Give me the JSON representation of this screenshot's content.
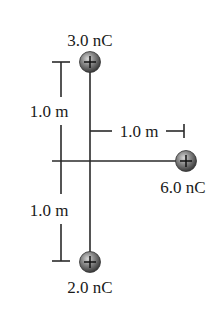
{
  "diagram": {
    "charges": [
      {
        "id": "top",
        "label": "3.0 nC",
        "sign": "+"
      },
      {
        "id": "right",
        "label": "6.0 nC",
        "sign": "+"
      },
      {
        "id": "bottom",
        "label": "2.0 nC",
        "sign": "+"
      }
    ],
    "dimensions": {
      "upper_vertical": "1.0 m",
      "lower_vertical": "1.0 m",
      "horizontal": "1.0 m"
    }
  }
}
